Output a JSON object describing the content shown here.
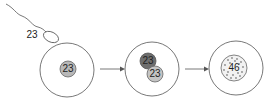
{
  "diagram": {
    "sperm_label": "23",
    "stage1": {
      "nucleus_label": "23"
    },
    "stage2": {
      "male_pronucleus_label": "23",
      "female_pronucleus_label": "23"
    },
    "stage3": {
      "zygote_nucleus_label": "46"
    },
    "colors": {
      "outline": "#555555",
      "nucleus_light": "#b8b8b8",
      "nucleus_dark": "#6e6e6e",
      "dots": "#8a8a8a"
    }
  }
}
